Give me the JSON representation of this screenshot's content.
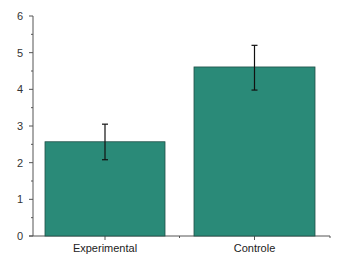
{
  "chart_data": {
    "type": "bar",
    "title": "",
    "xlabel": "",
    "ylabel": "",
    "categories": [
      "Experimental",
      "Controle"
    ],
    "values": [
      2.57,
      4.61
    ],
    "error_bars": [
      {
        "lower": 2.08,
        "upper": 3.05
      },
      {
        "lower": 3.98,
        "upper": 5.2
      }
    ],
    "ylim": [
      0,
      6
    ],
    "yticks": [
      "0",
      "1",
      "2",
      "3",
      "4",
      "5",
      "6"
    ],
    "grid": false,
    "legend": null,
    "bar_color": "#2a8a78",
    "bar_edge_color": "#1f4f47",
    "axis_color": "#555555"
  }
}
